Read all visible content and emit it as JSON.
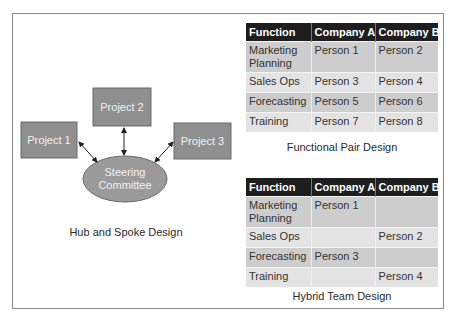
{
  "hub_and_spoke": {
    "title": "Hub and Spoke Design",
    "hub": {
      "line1": "Steering",
      "line2": "Committee"
    },
    "projects": [
      {
        "label": "Project 1"
      },
      {
        "label": "Project 2"
      },
      {
        "label": "Project 3"
      }
    ],
    "colors": {
      "box_fill": "#8f8f8f",
      "box_border": "#6a6a6a",
      "hub_fill": "#9a9a9a",
      "label_text": "#f2f2f2",
      "arrow": "#222222"
    }
  },
  "functional_pair": {
    "title": "Functional Pair Design",
    "headers": [
      "Function",
      "Company A",
      "Company B"
    ],
    "rows": [
      {
        "function": "Marketing Planning",
        "company_a": "Person 1",
        "company_b": "Person 2"
      },
      {
        "function": "Sales Ops",
        "company_a": "Person 3",
        "company_b": "Person 4"
      },
      {
        "function": "Forecasting",
        "company_a": "Person 5",
        "company_b": "Person 6"
      },
      {
        "function": "Training",
        "company_a": "Person 7",
        "company_b": "Person 8"
      }
    ]
  },
  "hybrid_team": {
    "title": "Hybrid Team Design",
    "headers": [
      "Function",
      "Company A",
      "Company B"
    ],
    "rows": [
      {
        "function": "Marketing Planning",
        "company_a": "Person 1",
        "company_b": ""
      },
      {
        "function": "Sales Ops",
        "company_a": "",
        "company_b": "Person 2"
      },
      {
        "function": "Forecasting",
        "company_a": "Person 3",
        "company_b": ""
      },
      {
        "function": "Training",
        "company_a": "",
        "company_b": "Person 4"
      }
    ]
  },
  "colors": {
    "header_bg": "#1e1e1e",
    "header_text": "#ffffff",
    "row_dark": "#cdcdcd",
    "row_light": "#e3e3e3",
    "frame_border": "#8a8a8a"
  }
}
